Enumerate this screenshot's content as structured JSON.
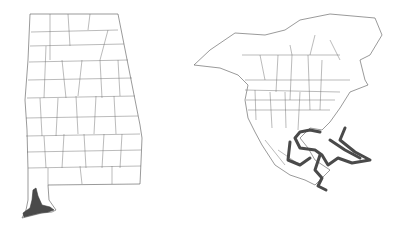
{
  "maps": [
    {
      "id": "alabama",
      "region": "Alabama counties",
      "highlighted_areas": [
        "Baldwin County (southwest coast)"
      ],
      "highlight_color": "#4a4a4a",
      "border_color": "#555555"
    },
    {
      "id": "north-america",
      "region": "North America (US states, Canadian provinces, Mexico, Central America)",
      "highlighted_areas": [
        "Gulf of Mexico coast",
        "Atlantic coast of Florida",
        "Caribbean / Bahamas",
        "Central America coast"
      ],
      "highlight_color": "#4a4a4a",
      "border_color": "#555555"
    }
  ]
}
